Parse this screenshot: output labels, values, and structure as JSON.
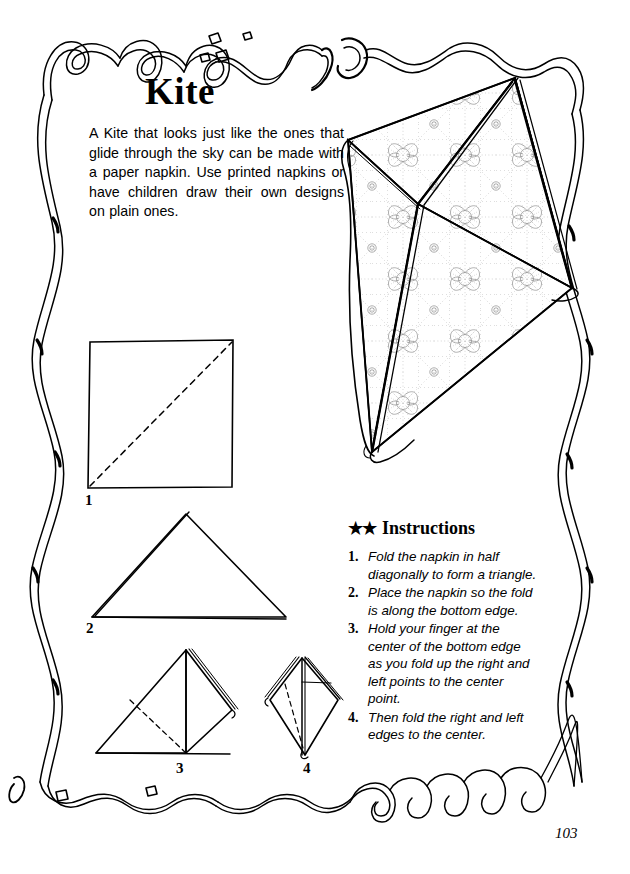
{
  "page": {
    "title": "Kite",
    "number": "103",
    "intro": "A Kite that looks just like the ones that glide through the sky can be made with a paper napkin. Use printed napkins or have children draw their own designs on plain ones."
  },
  "instructions": {
    "stars": "★★",
    "heading": "Instructions",
    "steps": [
      {
        "index": "1.",
        "text": "Fold the napkin in half diagonally to form a triangle."
      },
      {
        "index": "2.",
        "text": "Place the napkin so the fold is along the bottom edge."
      },
      {
        "index": "3.",
        "text": "Hold your finger at the center of the bottom edge as you fold up the right and left points to the center point."
      },
      {
        "index": "4.",
        "text": "Then fold the right and left edges to the center."
      }
    ]
  },
  "diagrams": {
    "step1_label": "1",
    "step2_label": "2",
    "step3_label": "3",
    "step4_label": "4"
  },
  "colors": {
    "ink": "#000000",
    "paper": "#ffffff",
    "pattern": "#8a8a8a"
  }
}
